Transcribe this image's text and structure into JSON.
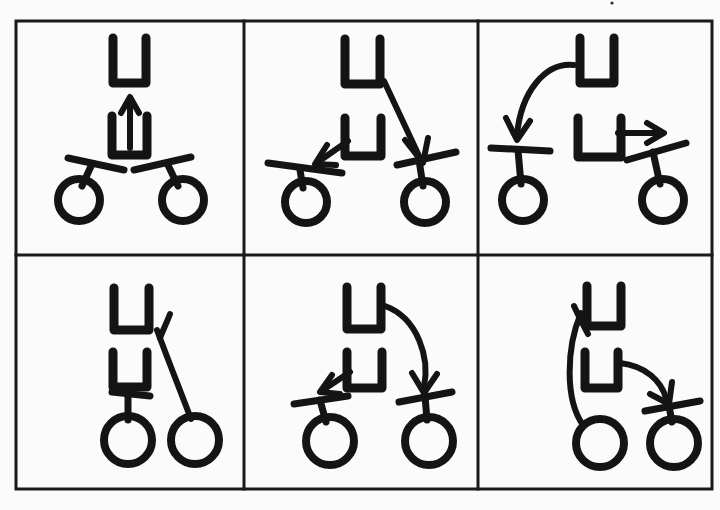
{
  "document": {
    "kind": "scanned-hand-drawn-diagram",
    "title": "Two-by-three grid of hand-drawn instruction panels",
    "background_color": "#fbfbfb",
    "ink_color": "#141414",
    "grid_color": "#1a1a1a"
  },
  "grid": {
    "rows": 2,
    "columns": 3,
    "left": 16,
    "top": 21,
    "right": 712,
    "bottom": 489,
    "column_dividers": [
      244,
      478
    ],
    "row_dividers": [
      255
    ],
    "border_width": 3
  },
  "legend": {
    "glyphs": [
      {
        "name": "u-shape",
        "description": "Open-topped square bracket, U shaped"
      },
      {
        "name": "circle-node",
        "description": "Hollow circle at the end of a short stem"
      },
      {
        "name": "handlebar",
        "description": "Short tilted bar crossing the top of a stem"
      },
      {
        "name": "arrow",
        "description": "Directional arrow with a V arrowhead"
      }
    ]
  },
  "panels": [
    {
      "id": "panel-1",
      "index": 1,
      "row": 1,
      "column": 1,
      "label": "Panel 1",
      "description": "Two stacked U shapes with an up arrow rising out of the lower U; two circle-and-bar nodes angled inward below.",
      "u_shapes": 2,
      "nodes": 2,
      "arrows": [
        {
          "name": "up-arrow",
          "direction": "up",
          "style": "straight",
          "from": "lower-u-interior",
          "to": "upper-u"
        }
      ]
    },
    {
      "id": "panel-2",
      "index": 2,
      "row": 1,
      "column": 2,
      "label": "Panel 2",
      "description": "Two stacked U shapes; a short arrow points down-left to the left node and a long arrow sweeps from the upper U down-right to the right node.",
      "u_shapes": 2,
      "nodes": 2,
      "arrows": [
        {
          "name": "down-left-arrow",
          "direction": "down-left",
          "style": "straight",
          "from": "lower-u",
          "to": "left-node"
        },
        {
          "name": "down-right-arrow",
          "direction": "down-right",
          "style": "straight",
          "from": "upper-u-right",
          "to": "right-node"
        }
      ]
    },
    {
      "id": "panel-3",
      "index": 3,
      "row": 1,
      "column": 3,
      "label": "Panel 3",
      "description": "Two stacked U shapes; a large curved arrow sweeps from the upper U left and down onto the left node, and a short right arrow exits the lower U toward the right node.",
      "u_shapes": 2,
      "nodes": 2,
      "arrows": [
        {
          "name": "curved-down-arrow",
          "direction": "down",
          "style": "curved",
          "from": "upper-u-left",
          "to": "left-node"
        },
        {
          "name": "right-arrow",
          "direction": "right",
          "style": "straight",
          "from": "lower-u",
          "to": "right-node"
        }
      ]
    },
    {
      "id": "panel-4",
      "index": 4,
      "row": 2,
      "column": 1,
      "label": "Panel 4",
      "description": "Two stacked U shapes with no arrows; the left node's bar sits under the lower U and the right node is joined by a long curved stem rising to the upper right.",
      "u_shapes": 2,
      "nodes": 2,
      "arrows": []
    },
    {
      "id": "panel-5",
      "index": 5,
      "row": 2,
      "column": 2,
      "label": "Panel 5",
      "description": "Two stacked U shapes; a short arrow points down-left to the left node and a long curved arrow sweeps from the upper U around and down onto the right node.",
      "u_shapes": 2,
      "nodes": 2,
      "arrows": [
        {
          "name": "down-left-arrow",
          "direction": "down-left",
          "style": "straight",
          "from": "lower-u",
          "to": "left-node"
        },
        {
          "name": "curved-down-arrow",
          "direction": "down",
          "style": "curved",
          "from": "upper-u-right",
          "to": "right-node"
        }
      ]
    },
    {
      "id": "panel-6",
      "index": 6,
      "row": 2,
      "column": 3,
      "label": "Panel 6",
      "description": "Two stacked U shapes; a long curved stem runs from the upper left down to the left node, and a curved arrow leaves the lower U heading down-right onto the right node.",
      "u_shapes": 2,
      "nodes": 2,
      "arrows": [
        {
          "name": "curved-down-right-arrow",
          "direction": "down-right",
          "style": "curved",
          "from": "lower-u",
          "to": "right-node"
        }
      ]
    }
  ],
  "artifacts": {
    "specks": [
      {
        "name": "scan-speck",
        "x": 612,
        "y": 3,
        "r": 1.6
      }
    ]
  }
}
